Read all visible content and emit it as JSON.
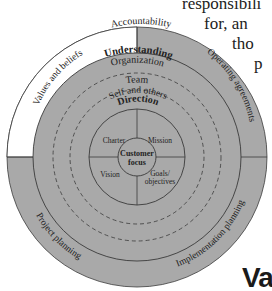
{
  "background_text": {
    "line1": "responsibili",
    "line2": "for, an",
    "line3": "tho",
    "line4": "p",
    "partial_heading": "Va"
  },
  "diagram": {
    "colors": {
      "fill_gray": "#a9a9a9",
      "white": "#ffffff",
      "stroke": "#3a3a3a"
    },
    "outer_ring": {
      "label": "Accountability",
      "segments": [
        {
          "label": "Values and beliefs",
          "fill": "white"
        },
        {
          "label": "Operating agreements",
          "fill": "gray"
        },
        {
          "label": "Implementation planning",
          "fill": "gray"
        },
        {
          "label": "Project planning",
          "fill": "gray"
        }
      ]
    },
    "rings": {
      "understanding": "Understanding",
      "organization": "Organization",
      "team": "Team",
      "self_and_others": "Self and others",
      "direction": "Direction"
    },
    "quadrants": {
      "top_left": "Charter",
      "top_right": "Mission",
      "bottom_left": "Vision",
      "bottom_right_line1": "Goals/",
      "bottom_right_line2": "objectives"
    },
    "center": {
      "line1": "Customer",
      "line2": "focus"
    }
  }
}
